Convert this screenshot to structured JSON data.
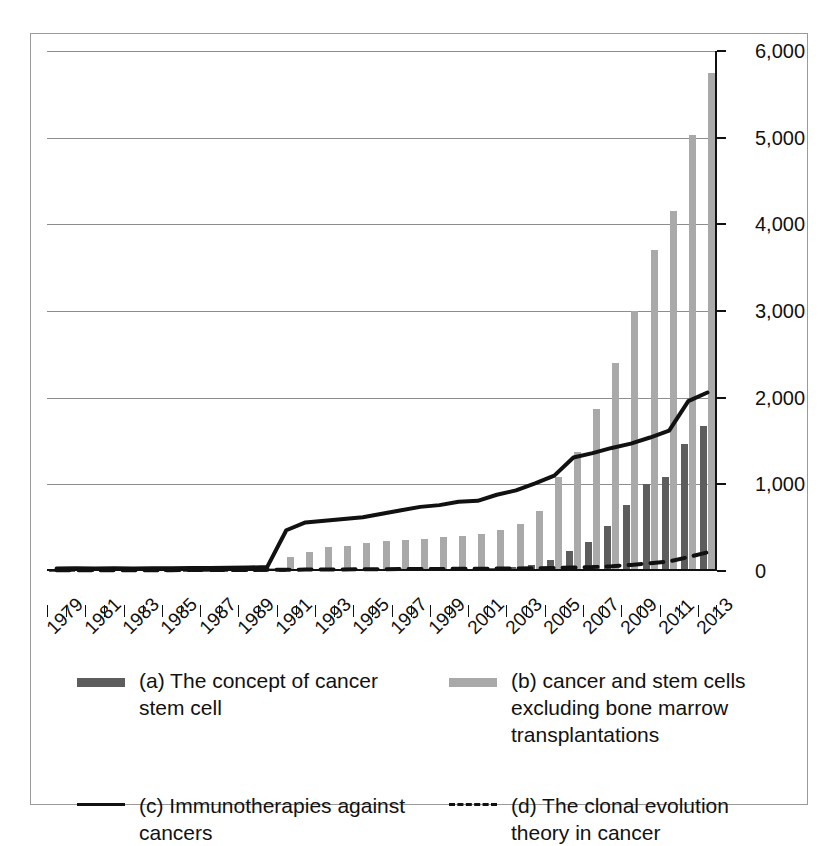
{
  "chart_data": {
    "type": "bar",
    "title": "",
    "subtitle": "",
    "xlabel": "",
    "ylabel": "",
    "ylim": [
      0,
      6000
    ],
    "ytick_labels": [
      "0",
      "1,000",
      "2,000",
      "3,000",
      "4,000",
      "5,000",
      "6,000"
    ],
    "ytick_values": [
      0,
      1000,
      2000,
      3000,
      4000,
      5000,
      6000
    ],
    "grid": true,
    "legend_position": "below",
    "x": [
      1979,
      1980,
      1981,
      1982,
      1983,
      1984,
      1985,
      1986,
      1987,
      1988,
      1989,
      1990,
      1991,
      1992,
      1993,
      1994,
      1995,
      1996,
      1997,
      1998,
      1999,
      2000,
      2001,
      2002,
      2003,
      2004,
      2005,
      2006,
      2007,
      2008,
      2009,
      2010,
      2011,
      2012,
      2013
    ],
    "xtick_labels": [
      "1979",
      "1981",
      "1983",
      "1985",
      "1987",
      "1989",
      "1991",
      "1993",
      "1995",
      "1997",
      "1999",
      "2001",
      "2003",
      "2005",
      "2007",
      "2009",
      "2011",
      "2013"
    ],
    "series": [
      {
        "name": "(a) The concept of cancer stem cell",
        "key": "a",
        "kind": "bar",
        "color": "#5d5d5d",
        "values": [
          2,
          2,
          2,
          2,
          2,
          2,
          2,
          2,
          2,
          2,
          3,
          3,
          5,
          6,
          8,
          10,
          12,
          14,
          16,
          18,
          20,
          24,
          28,
          34,
          45,
          70,
          130,
          230,
          340,
          520,
          760,
          1000,
          1090,
          1470,
          1670
        ]
      },
      {
        "name": "(b) cancer and stem cells excluding bone marrow transplantations",
        "key": "b",
        "kind": "bar",
        "color": "#a9a9a9",
        "values": [
          0,
          0,
          0,
          0,
          0,
          0,
          0,
          0,
          0,
          0,
          0,
          40,
          160,
          215,
          280,
          290,
          320,
          345,
          355,
          370,
          390,
          400,
          430,
          470,
          540,
          690,
          1090,
          1370,
          1870,
          2400,
          3000,
          3700,
          4150,
          5030,
          5750
        ]
      },
      {
        "name": "(c) Immunotherapies against cancers",
        "key": "c",
        "kind": "line",
        "style": "solid",
        "color": "#111111",
        "values": [
          30,
          32,
          30,
          31,
          30,
          33,
          32,
          34,
          36,
          38,
          40,
          45,
          470,
          560,
          580,
          600,
          620,
          660,
          700,
          740,
          760,
          800,
          810,
          880,
          930,
          1010,
          1100,
          1310,
          1360,
          1420,
          1470,
          1540,
          1620,
          1960,
          2060
        ]
      },
      {
        "name": "(d) The clonal evolution theory in cancer",
        "key": "d",
        "kind": "line",
        "style": "dashed",
        "color": "#111111",
        "values": [
          10,
          10,
          10,
          10,
          10,
          10,
          10,
          12,
          12,
          12,
          12,
          14,
          15,
          16,
          18,
          18,
          20,
          20,
          22,
          22,
          24,
          25,
          26,
          28,
          30,
          32,
          36,
          40,
          45,
          55,
          70,
          90,
          110,
          160,
          215
        ]
      }
    ]
  },
  "legend": {
    "items": [
      {
        "id": "a",
        "marker": "bar-dark",
        "label_line1": "(a) The concept of cancer",
        "label_line2": "stem cell",
        "label_line3": ""
      },
      {
        "id": "b",
        "marker": "bar-light",
        "label_line1": "(b) cancer and stem cells",
        "label_line2": "excluding bone marrow",
        "label_line3": "transplantations"
      },
      {
        "id": "c",
        "marker": "solid-line",
        "label_line1": "(c) Immunotherapies against",
        "label_line2": "cancers",
        "label_line3": ""
      },
      {
        "id": "d",
        "marker": "dashed-line",
        "label_line1": "(d) The clonal evolution",
        "label_line2": "theory in cancer",
        "label_line3": ""
      }
    ]
  },
  "colors": {
    "series_a": "#5d5d5d",
    "series_b": "#a9a9a9",
    "series_c": "#111111",
    "series_d": "#111111",
    "gridline": "#8d8d8d",
    "frame": "#9a9a9a",
    "background": "#ffffff"
  }
}
